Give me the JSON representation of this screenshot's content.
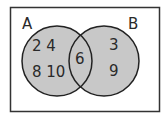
{
  "diagram": {
    "type": "venn",
    "colors": {
      "fill": "#c8c8c8",
      "stroke": "#222222",
      "frame": "#333333",
      "background": "#ffffff"
    },
    "sets": [
      {
        "label": "A",
        "only_elements": [
          "2",
          "4",
          "8",
          "10"
        ]
      },
      {
        "label": "B",
        "only_elements": [
          "3",
          "9"
        ]
      }
    ],
    "intersection": [
      "6"
    ],
    "text": {
      "setA_label": "A",
      "setB_label": "B",
      "a_row1": "2 4",
      "a_row2": "8 10",
      "ab": "6",
      "b_row1": "3",
      "b_row2": "9"
    }
  }
}
